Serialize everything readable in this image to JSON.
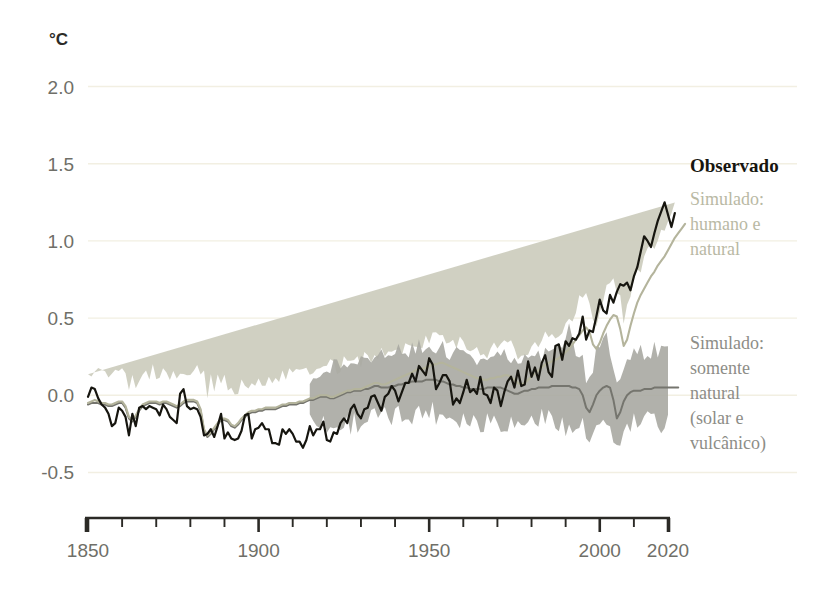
{
  "chart_data": {
    "type": "line",
    "title": "",
    "subtitle": "",
    "xlabel": "",
    "ylabel": "°C",
    "unit_label": "°C",
    "xlim": [
      1850,
      2020
    ],
    "ylim": [
      -0.62,
      2.12
    ],
    "yticks": [
      -0.5,
      0.0,
      0.5,
      1.0,
      1.5,
      2.0
    ],
    "ytick_labels": [
      "-0.5",
      "0.0",
      "0.5",
      "1.0",
      "1.5",
      "2.0"
    ],
    "xticks": [
      1850,
      1860,
      1870,
      1880,
      1890,
      1900,
      1910,
      1920,
      1930,
      1940,
      1950,
      1960,
      1970,
      1980,
      1990,
      2000,
      2010,
      2020
    ],
    "xtick_labels_shown": [
      "1850",
      "1900",
      "1950",
      "2000",
      "2020"
    ],
    "xtick_labeled_values": [
      1850,
      1900,
      1950,
      2000,
      2020
    ],
    "grid": "horizontal-faint",
    "legend_position": "right",
    "colors": {
      "observed_line": "#16150f",
      "human_natural_line": "#b4b49c",
      "human_natural_band": "#cdcdbf",
      "natural_only_line": "#75756e",
      "natural_only_band": "#a9a9a2",
      "grid": "#f2efe2",
      "axis": "#2b2a26",
      "background": "#ffffff"
    },
    "legend": [
      {
        "key": "observed",
        "label": "Observado",
        "style": "bold-serif",
        "color": "#16150f"
      },
      {
        "key": "human_natural",
        "label": "Simulado:\nhumano e\nnatural",
        "lines": [
          "Simulado:",
          "humano e",
          "natural"
        ],
        "color": "#b9b9a4"
      },
      {
        "key": "natural_only",
        "label": "Simulado:\nsomente\nnatural\n(solar e\nvulcânico)",
        "lines": [
          "Simulado:",
          "somente",
          "natural",
          "(solar e",
          "vulcânico)"
        ],
        "color": "#8d8d87"
      }
    ],
    "series": [
      {
        "name": "Observado",
        "x_start": 1850,
        "x_step": 1,
        "values": [
          -0.01,
          0.05,
          0.04,
          -0.02,
          -0.06,
          -0.08,
          -0.12,
          -0.2,
          -0.18,
          -0.08,
          -0.1,
          -0.14,
          -0.26,
          -0.12,
          -0.2,
          -0.08,
          -0.07,
          -0.09,
          -0.07,
          -0.08,
          -0.09,
          -0.13,
          -0.06,
          -0.09,
          -0.14,
          -0.16,
          -0.18,
          0.01,
          0.04,
          -0.07,
          -0.09,
          -0.08,
          -0.09,
          -0.14,
          -0.26,
          -0.25,
          -0.22,
          -0.27,
          -0.2,
          -0.12,
          -0.28,
          -0.24,
          -0.28,
          -0.29,
          -0.28,
          -0.23,
          -0.13,
          -0.12,
          -0.28,
          -0.22,
          -0.21,
          -0.18,
          -0.22,
          -0.22,
          -0.31,
          -0.31,
          -0.32,
          -0.22,
          -0.25,
          -0.22,
          -0.25,
          -0.3,
          -0.3,
          -0.34,
          -0.29,
          -0.2,
          -0.26,
          -0.22,
          -0.22,
          -0.17,
          -0.29,
          -0.3,
          -0.24,
          -0.25,
          -0.18,
          -0.15,
          -0.18,
          -0.09,
          -0.06,
          -0.12,
          -0.15,
          -0.09,
          -0.08,
          -0.01,
          0.0,
          -0.05,
          -0.1,
          -0.01,
          0.01,
          0.06,
          0.03,
          -0.04,
          0.02,
          0.08,
          0.08,
          0.14,
          0.09,
          0.19,
          0.16,
          0.13,
          0.24,
          0.2,
          0.04,
          0.08,
          0.13,
          0.13,
          0.09,
          -0.06,
          -0.02,
          -0.05,
          0.02,
          0.1,
          0.02,
          0.04,
          0.01,
          0.12,
          0.01,
          0.0,
          -0.05,
          0.05,
          0.03,
          -0.07,
          0.02,
          0.09,
          0.12,
          0.05,
          0.16,
          0.06,
          0.07,
          0.22,
          0.12,
          0.18,
          0.1,
          0.21,
          0.26,
          0.15,
          0.12,
          0.32,
          0.33,
          0.23,
          0.35,
          0.32,
          0.37,
          0.36,
          0.4,
          0.51,
          0.36,
          0.42,
          0.41,
          0.51,
          0.62,
          0.55,
          0.53,
          0.65,
          0.6,
          0.67,
          0.72,
          0.71,
          0.73,
          0.68,
          0.77,
          0.83,
          0.93,
          1.03,
          1.0,
          0.96,
          1.05,
          1.13,
          1.19,
          1.25,
          1.17,
          1.09,
          1.18
        ]
      },
      {
        "name": "Simulado: humano e natural",
        "x_start": 1850,
        "x_step": 1,
        "values": [
          -0.05,
          -0.04,
          -0.03,
          -0.04,
          -0.05,
          -0.05,
          -0.06,
          -0.06,
          -0.05,
          -0.04,
          -0.04,
          -0.07,
          -0.14,
          -0.16,
          -0.13,
          -0.09,
          -0.06,
          -0.05,
          -0.04,
          -0.04,
          -0.04,
          -0.05,
          -0.04,
          -0.04,
          -0.05,
          -0.06,
          -0.07,
          -0.06,
          -0.04,
          -0.03,
          -0.03,
          -0.03,
          -0.04,
          -0.09,
          -0.22,
          -0.26,
          -0.24,
          -0.21,
          -0.18,
          -0.15,
          -0.15,
          -0.16,
          -0.19,
          -0.2,
          -0.18,
          -0.15,
          -0.13,
          -0.11,
          -0.1,
          -0.1,
          -0.09,
          -0.09,
          -0.08,
          -0.08,
          -0.08,
          -0.08,
          -0.07,
          -0.06,
          -0.06,
          -0.05,
          -0.05,
          -0.05,
          -0.04,
          -0.04,
          -0.03,
          -0.02,
          -0.02,
          -0.01,
          0.0,
          0.0,
          0.0,
          -0.01,
          -0.01,
          0.0,
          0.01,
          0.02,
          0.03,
          0.03,
          0.04,
          0.04,
          0.04,
          0.05,
          0.06,
          0.07,
          0.08,
          0.08,
          0.07,
          0.07,
          0.08,
          0.09,
          0.1,
          0.11,
          0.12,
          0.13,
          0.14,
          0.15,
          0.16,
          0.17,
          0.17,
          0.18,
          0.19,
          0.2,
          0.2,
          0.21,
          0.21,
          0.2,
          0.19,
          0.18,
          0.17,
          0.16,
          0.15,
          0.14,
          0.13,
          0.12,
          0.11,
          0.11,
          0.1,
          0.1,
          0.11,
          0.11,
          0.12,
          0.12,
          0.13,
          0.13,
          0.12,
          0.1,
          0.08,
          0.07,
          0.08,
          0.1,
          0.12,
          0.14,
          0.16,
          0.18,
          0.2,
          0.21,
          0.22,
          0.23,
          0.24,
          0.26,
          0.28,
          0.3,
          0.33,
          0.36,
          0.39,
          0.42,
          0.44,
          0.41,
          0.33,
          0.3,
          0.34,
          0.4,
          0.45,
          0.49,
          0.52,
          0.51,
          0.43,
          0.32,
          0.36,
          0.45,
          0.53,
          0.6,
          0.65,
          0.69,
          0.73,
          0.77,
          0.8,
          0.84,
          0.87,
          0.9,
          0.94,
          0.98,
          1.02,
          1.05,
          1.08,
          1.11
        ]
      },
      {
        "name": "Simulado: somente natural (solar e vulcânico)",
        "x_start": 1850,
        "x_step": 1,
        "values": [
          -0.06,
          -0.05,
          -0.05,
          -0.05,
          -0.06,
          -0.06,
          -0.07,
          -0.07,
          -0.06,
          -0.05,
          -0.05,
          -0.08,
          -0.15,
          -0.17,
          -0.14,
          -0.1,
          -0.07,
          -0.06,
          -0.05,
          -0.05,
          -0.05,
          -0.06,
          -0.05,
          -0.05,
          -0.06,
          -0.07,
          -0.08,
          -0.07,
          -0.05,
          -0.04,
          -0.04,
          -0.04,
          -0.05,
          -0.1,
          -0.23,
          -0.27,
          -0.25,
          -0.22,
          -0.19,
          -0.16,
          -0.16,
          -0.17,
          -0.2,
          -0.21,
          -0.19,
          -0.16,
          -0.14,
          -0.12,
          -0.11,
          -0.11,
          -0.1,
          -0.1,
          -0.09,
          -0.09,
          -0.09,
          -0.09,
          -0.08,
          -0.07,
          -0.07,
          -0.06,
          -0.06,
          -0.06,
          -0.05,
          -0.05,
          -0.04,
          -0.03,
          -0.03,
          -0.02,
          -0.01,
          -0.01,
          -0.01,
          -0.02,
          -0.02,
          -0.01,
          0.0,
          0.01,
          0.02,
          0.02,
          0.03,
          0.03,
          0.03,
          0.04,
          0.04,
          0.05,
          0.06,
          0.06,
          0.05,
          0.05,
          0.05,
          0.06,
          0.06,
          0.07,
          0.07,
          0.08,
          0.08,
          0.09,
          0.09,
          0.09,
          0.09,
          0.1,
          0.1,
          0.1,
          0.1,
          0.09,
          0.09,
          0.08,
          0.07,
          0.07,
          0.06,
          0.06,
          0.05,
          0.05,
          0.04,
          0.04,
          0.04,
          0.04,
          0.04,
          0.05,
          0.05,
          0.05,
          0.05,
          0.05,
          0.04,
          0.03,
          0.02,
          0.01,
          0.01,
          0.02,
          0.03,
          0.03,
          0.04,
          0.04,
          0.05,
          0.05,
          0.05,
          0.05,
          0.06,
          0.06,
          0.06,
          0.06,
          0.06,
          0.06,
          0.05,
          0.05,
          0.04,
          0.0,
          -0.08,
          -0.11,
          -0.06,
          0.0,
          0.03,
          0.05,
          0.06,
          0.05,
          -0.03,
          -0.15,
          -0.11,
          -0.04,
          0.0,
          0.02,
          0.03,
          0.03,
          0.03,
          0.04,
          0.04,
          0.04,
          0.05,
          0.05,
          0.05,
          0.05,
          0.05,
          0.05,
          0.05,
          0.05
        ]
      }
    ],
    "bands": [
      {
        "name": "Simulado: humano e natural (faixa)",
        "x_start": 1850,
        "x_step": 1,
        "half_width": [
          0.17,
          0.18,
          0.17,
          0.18,
          0.19,
          0.18,
          0.17,
          0.18,
          0.19,
          0.18,
          0.17,
          0.19,
          0.22,
          0.24,
          0.22,
          0.19,
          0.18,
          0.17,
          0.18,
          0.19,
          0.18,
          0.17,
          0.18,
          0.19,
          0.18,
          0.17,
          0.18,
          0.19,
          0.18,
          0.17,
          0.18,
          0.19,
          0.2,
          0.24,
          0.3,
          0.32,
          0.3,
          0.27,
          0.25,
          0.23,
          0.22,
          0.23,
          0.25,
          0.26,
          0.24,
          0.22,
          0.2,
          0.19,
          0.18,
          0.18,
          0.17,
          0.18,
          0.17,
          0.18,
          0.17,
          0.18,
          0.17,
          0.18,
          0.17,
          0.18,
          0.17,
          0.18,
          0.17,
          0.18,
          0.17,
          0.18,
          0.17,
          0.18,
          0.17,
          0.18,
          0.19,
          0.2,
          0.19,
          0.18,
          0.17,
          0.18,
          0.17,
          0.18,
          0.17,
          0.18,
          0.17,
          0.18,
          0.17,
          0.18,
          0.17,
          0.18,
          0.19,
          0.18,
          0.17,
          0.18,
          0.17,
          0.18,
          0.17,
          0.18,
          0.17,
          0.18,
          0.17,
          0.18,
          0.17,
          0.18,
          0.17,
          0.18,
          0.17,
          0.18,
          0.17,
          0.18,
          0.19,
          0.18,
          0.17,
          0.18,
          0.17,
          0.18,
          0.17,
          0.18,
          0.17,
          0.18,
          0.17,
          0.18,
          0.17,
          0.18,
          0.17,
          0.18,
          0.19,
          0.2,
          0.21,
          0.2,
          0.19,
          0.18,
          0.17,
          0.18,
          0.17,
          0.18,
          0.17,
          0.18,
          0.17,
          0.18,
          0.17,
          0.18,
          0.17,
          0.18,
          0.17,
          0.18,
          0.19,
          0.22,
          0.24,
          0.23,
          0.2,
          0.18,
          0.17,
          0.18,
          0.17,
          0.18,
          0.21,
          0.25,
          0.23,
          0.2,
          0.18,
          0.17,
          0.18,
          0.17,
          0.18,
          0.17,
          0.18,
          0.17,
          0.18,
          0.17,
          0.18,
          0.17,
          0.18,
          0.17,
          0.18,
          0.17,
          0.18
        ]
      },
      {
        "name": "Simulado: somente natural (faixa)",
        "x_start": 1915,
        "x_step": 1,
        "half_width": [
          0.1,
          0.12,
          0.14,
          0.16,
          0.18,
          0.19,
          0.2,
          0.2,
          0.21,
          0.2,
          0.21,
          0.2,
          0.21,
          0.2,
          0.21,
          0.22,
          0.21,
          0.2,
          0.21,
          0.2,
          0.21,
          0.22,
          0.21,
          0.2,
          0.21,
          0.2,
          0.21,
          0.22,
          0.21,
          0.2,
          0.21,
          0.2,
          0.21,
          0.22,
          0.21,
          0.2,
          0.21,
          0.22,
          0.23,
          0.22,
          0.21,
          0.2,
          0.21,
          0.22,
          0.21,
          0.2,
          0.21,
          0.22,
          0.21,
          0.2,
          0.21,
          0.22,
          0.21,
          0.2,
          0.21,
          0.22,
          0.23,
          0.22,
          0.21,
          0.2,
          0.21,
          0.22,
          0.21,
          0.2,
          0.21,
          0.22,
          0.21,
          0.2,
          0.21,
          0.22,
          0.21,
          0.2,
          0.21,
          0.22,
          0.25,
          0.3,
          0.33,
          0.3,
          0.26,
          0.23,
          0.22,
          0.21,
          0.22,
          0.21,
          0.26,
          0.34,
          0.31,
          0.27,
          0.24,
          0.23,
          0.22,
          0.23,
          0.22,
          0.23,
          0.22,
          0.23,
          0.22,
          0.23,
          0.22,
          0.23,
          0.22,
          0.23,
          0.22,
          0.23,
          0.22,
          0.23
        ]
      }
    ]
  }
}
